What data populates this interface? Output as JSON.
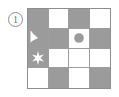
{
  "figure": {
    "index_label": "1",
    "colors": {
      "gray_fill": "#9b9b9b",
      "white_fill": "#ffffff",
      "grid_line": "#9d9d9d",
      "border": "#8e8e8e",
      "label_text": "#6e6e6e"
    },
    "grid": {
      "rows": 4,
      "columns": 4,
      "cells": [
        {
          "row": 1,
          "col": 1,
          "fill": "gray",
          "glyph": null
        },
        {
          "row": 1,
          "col": 2,
          "fill": "white",
          "glyph": null
        },
        {
          "row": 1,
          "col": 3,
          "fill": "gray",
          "glyph": null
        },
        {
          "row": 1,
          "col": 4,
          "fill": "white",
          "glyph": null
        },
        {
          "row": 2,
          "col": 1,
          "fill": "gray",
          "glyph": "pacman-wedge-white"
        },
        {
          "row": 2,
          "col": 2,
          "fill": "gray",
          "glyph": null
        },
        {
          "row": 2,
          "col": 3,
          "fill": "white",
          "glyph": "circle-gray"
        },
        {
          "row": 2,
          "col": 4,
          "fill": "gray",
          "glyph": null
        },
        {
          "row": 3,
          "col": 1,
          "fill": "gray",
          "glyph": "six-point-star-white"
        },
        {
          "row": 3,
          "col": 2,
          "fill": "white",
          "glyph": null
        },
        {
          "row": 3,
          "col": 3,
          "fill": "white",
          "glyph": null
        },
        {
          "row": 3,
          "col": 4,
          "fill": "white",
          "glyph": null
        },
        {
          "row": 4,
          "col": 1,
          "fill": "white",
          "glyph": null
        },
        {
          "row": 4,
          "col": 2,
          "fill": "gray",
          "glyph": null
        },
        {
          "row": 4,
          "col": 3,
          "fill": "white",
          "glyph": null
        },
        {
          "row": 4,
          "col": 4,
          "fill": "gray",
          "glyph": null
        }
      ]
    }
  }
}
